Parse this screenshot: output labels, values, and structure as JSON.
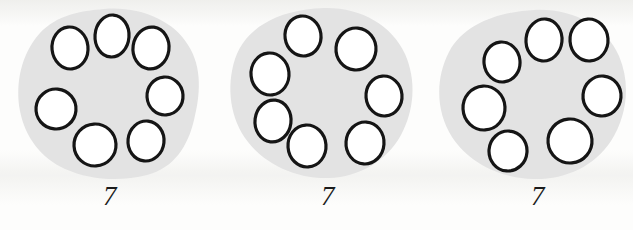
{
  "page": {
    "kind": "counting-worksheet",
    "background_color": "#fdfdfc"
  },
  "style": {
    "blob_fill": "#e3e3e3",
    "blob_stroke": "none",
    "circle_fill": "#ffffff",
    "circle_stroke": "#151515",
    "circle_stroke_width": 3.2,
    "label_color": "#1b1b1b"
  },
  "groups": [
    {
      "id": "group-1",
      "label": "7",
      "count": 7,
      "circles": [
        {
          "cx": 62,
          "cy": 44,
          "rx": 18,
          "ry": 21,
          "rot": -6
        },
        {
          "cx": 104,
          "cy": 32,
          "rx": 17,
          "ry": 21,
          "rot": 4
        },
        {
          "cx": 143,
          "cy": 44,
          "rx": 18,
          "ry": 21,
          "rot": 8
        },
        {
          "cx": 157,
          "cy": 92,
          "rx": 18,
          "ry": 19,
          "rot": -4
        },
        {
          "cx": 138,
          "cy": 137,
          "rx": 18,
          "ry": 20,
          "rot": 6
        },
        {
          "cx": 87,
          "cy": 141,
          "rx": 21,
          "ry": 21,
          "rot": -3
        },
        {
          "cx": 48,
          "cy": 105,
          "rx": 20,
          "ry": 20,
          "rot": 5
        }
      ],
      "blob_path": "M 96 5 C 131 2 165 16 180 41 C 195 64 192 92 186 116 C 180 142 166 164 139 171 C 112 178 82 176 57 165 C 33 154 17 133 12 107 C 7 80 13 50 32 29 C 49 11 72 7 96 5 Z"
    },
    {
      "id": "group-2",
      "label": "7",
      "count": 7,
      "circles": [
        {
          "cx": 85,
          "cy": 32,
          "rx": 18,
          "ry": 20,
          "rot": -8
        },
        {
          "cx": 138,
          "cy": 45,
          "rx": 20,
          "ry": 21,
          "rot": 5
        },
        {
          "cx": 166,
          "cy": 92,
          "rx": 18,
          "ry": 20,
          "rot": -5
        },
        {
          "cx": 147,
          "cy": 139,
          "rx": 19,
          "ry": 21,
          "rot": 4
        },
        {
          "cx": 89,
          "cy": 142,
          "rx": 19,
          "ry": 21,
          "rot": -4
        },
        {
          "cx": 55,
          "cy": 117,
          "rx": 18,
          "ry": 21,
          "rot": 7
        },
        {
          "cx": 52,
          "cy": 70,
          "rx": 19,
          "ry": 21,
          "rot": -6
        }
      ],
      "blob_path": "M 106 4 C 142 3 174 21 187 50 C 199 77 196 107 183 131 C 169 157 141 173 111 174 C 80 175 49 162 30 138 C 12 115 8 83 17 55 C 27 26 56 6 106 4 Z"
    },
    {
      "id": "group-3",
      "label": "7",
      "count": 7,
      "circles": [
        {
          "cx": 78,
          "cy": 58,
          "rx": 18,
          "ry": 20,
          "rot": -6
        },
        {
          "cx": 120,
          "cy": 36,
          "rx": 18,
          "ry": 21,
          "rot": 6
        },
        {
          "cx": 165,
          "cy": 36,
          "rx": 19,
          "ry": 21,
          "rot": -4
        },
        {
          "cx": 178,
          "cy": 92,
          "rx": 19,
          "ry": 20,
          "rot": 5
        },
        {
          "cx": 146,
          "cy": 137,
          "rx": 22,
          "ry": 22,
          "rot": -5
        },
        {
          "cx": 84,
          "cy": 147,
          "rx": 19,
          "ry": 20,
          "rot": 4
        },
        {
          "cx": 60,
          "cy": 104,
          "rx": 21,
          "ry": 22,
          "rot": -3
        }
      ],
      "blob_path": "M 110 6 C 148 4 182 22 195 52 C 207 80 203 112 187 137 C 170 163 140 176 109 175 C 76 174 45 159 28 133 C 12 108 11 75 25 48 C 40 20 74 8 110 6 Z"
    }
  ]
}
